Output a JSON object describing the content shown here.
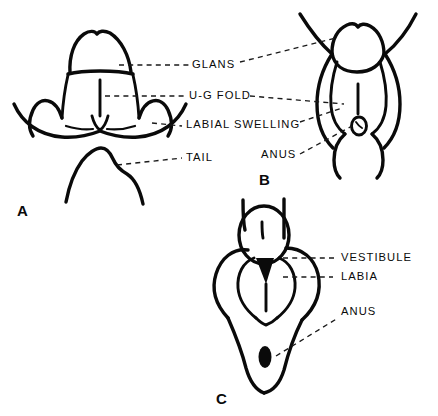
{
  "figure": {
    "background_color": "#ffffff",
    "ink_color": "#0a0a0a",
    "panels": [
      {
        "letter": "A",
        "description": "Indifferent stage external genitalia, frontal view with tail below",
        "labels": [
          "GLANS",
          "U-G FOLD",
          "LABIAL SWELLING",
          "TAIL"
        ]
      },
      {
        "letter": "B",
        "description": "Intermediate stage external genitalia with anus",
        "labels": [
          "GLANS",
          "U-G FOLD",
          "LABIAL SWELLING",
          "ANUS"
        ]
      },
      {
        "letter": "C",
        "description": "Female external genitalia with vestibule, labia and anus",
        "labels": [
          "VESTIBULE",
          "LABIA",
          "ANUS"
        ]
      }
    ]
  },
  "labels": {
    "glans": "GLANS",
    "ug_fold": "U-G FOLD",
    "labial_swelling": "LABIAL SWELLING",
    "tail": "TAIL",
    "anus_b": "ANUS",
    "vestibule": "VESTIBULE",
    "labia": "LABIA",
    "anus_c": "ANUS"
  },
  "panel_letters": {
    "a": "A",
    "b": "B",
    "c": "C"
  }
}
